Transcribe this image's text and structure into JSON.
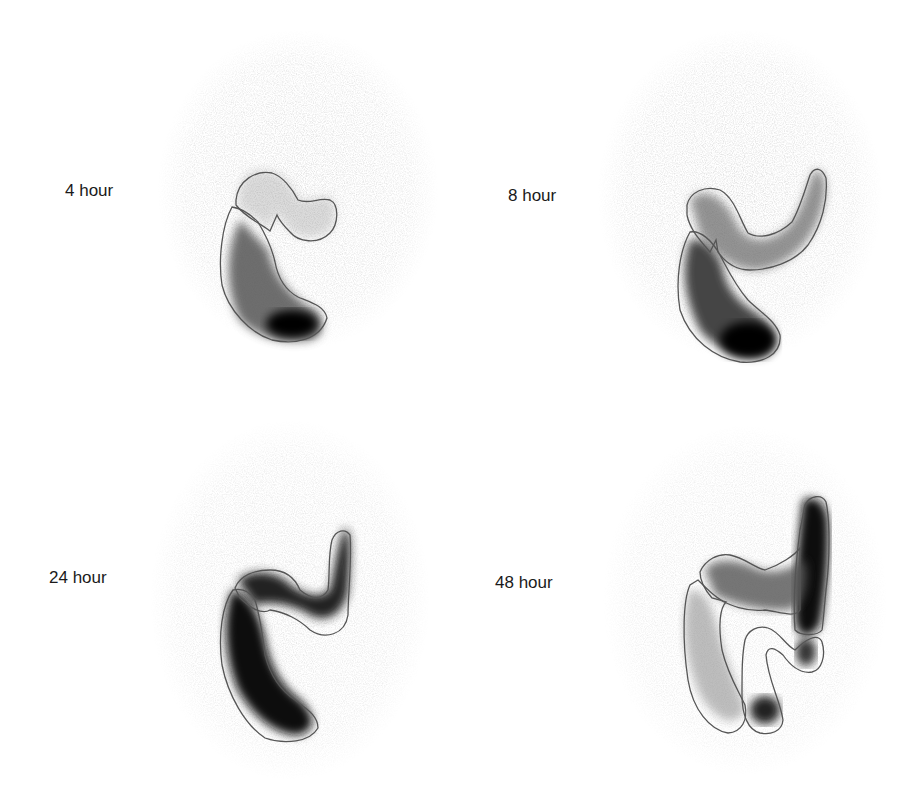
{
  "figure": {
    "panels": [
      {
        "id": "4h",
        "label": "4 hour"
      },
      {
        "id": "8h",
        "label": "8 hour"
      },
      {
        "id": "24h",
        "label": "24 hour"
      },
      {
        "id": "48h",
        "label": "48 hour"
      }
    ]
  }
}
